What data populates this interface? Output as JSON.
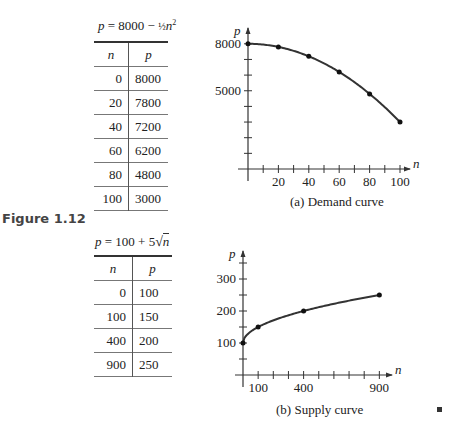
{
  "figure_label": "Figure 1.12",
  "end_mark": "■",
  "demand": {
    "formula_prefix": "p = 8000 − ",
    "formula_frac": "½",
    "formula_suffix": "n²",
    "table": {
      "headers": [
        "n",
        "p"
      ],
      "rows": [
        [
          "0",
          "8000"
        ],
        [
          "20",
          "7800"
        ],
        [
          "40",
          "7200"
        ],
        [
          "60",
          "6200"
        ],
        [
          "80",
          "4800"
        ],
        [
          "100",
          "3000"
        ]
      ]
    },
    "caption": "(a)   Demand curve"
  },
  "supply": {
    "formula_prefix": "p = 100 + 5",
    "formula_sqrt": "√n",
    "table": {
      "headers": [
        "n",
        "p"
      ],
      "rows": [
        [
          "0",
          "100"
        ],
        [
          "100",
          "150"
        ],
        [
          "400",
          "200"
        ],
        [
          "900",
          "250"
        ]
      ]
    },
    "caption": "(b)   Supply curve"
  },
  "chart_data": [
    {
      "type": "line",
      "title": "(a) Demand curve",
      "xlabel": "n",
      "ylabel": "p",
      "x": [
        0,
        20,
        40,
        60,
        80,
        100
      ],
      "series": [
        {
          "name": "p = 8000 - 1/2 n^2",
          "values": [
            8000,
            7800,
            7200,
            6200,
            4800,
            3000
          ]
        }
      ],
      "x_tick_labels": [
        "20",
        "40",
        "60",
        "80",
        "100"
      ],
      "y_tick_labels": [
        "5000",
        "8000"
      ],
      "xlim": [
        0,
        100
      ],
      "ylim": [
        0,
        8000
      ],
      "grid": false,
      "markers": true
    },
    {
      "type": "line",
      "title": "(b) Supply curve",
      "xlabel": "n",
      "ylabel": "p",
      "x": [
        0,
        100,
        400,
        900
      ],
      "series": [
        {
          "name": "p = 100 + 5 sqrt(n)",
          "values": [
            100,
            150,
            200,
            250
          ]
        }
      ],
      "x_tick_labels": [
        "100",
        "400",
        "900"
      ],
      "y_tick_labels": [
        "100",
        "200",
        "300"
      ],
      "xlim": [
        0,
        900
      ],
      "ylim": [
        0,
        350
      ],
      "grid": false,
      "markers": true
    }
  ]
}
